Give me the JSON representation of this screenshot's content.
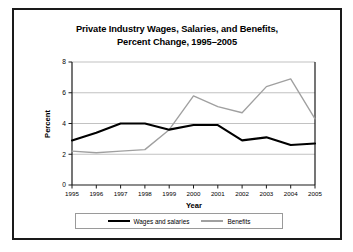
{
  "chart_data": {
    "type": "line",
    "title": "Private Industry Wages, Salaries, and Benefits, Percent Change, 1995–2005",
    "title_line1": "Private Industry Wages, Salaries, and Benefits,",
    "title_line2": "Percent Change, 1995–2005",
    "xlabel": "Year",
    "ylabel": "Percent",
    "categories": [
      "1995",
      "1996",
      "1997",
      "1998",
      "1999",
      "2000",
      "2001",
      "2002",
      "2003",
      "2004",
      "2005"
    ],
    "x": [
      1995,
      1996,
      1997,
      1998,
      1999,
      2000,
      2001,
      2002,
      2003,
      2004,
      2005
    ],
    "ylim": [
      0,
      8
    ],
    "xlim": [
      1995,
      2005
    ],
    "yticks": [
      "0",
      "2",
      "4",
      "6",
      "8"
    ],
    "ytick_values": [
      0,
      2,
      4,
      6,
      8
    ],
    "grid": true,
    "legend_position": "bottom",
    "series": [
      {
        "name": "Wages and salaries",
        "color": "#000000",
        "values": [
          2.9,
          3.4,
          4.0,
          4.0,
          3.6,
          3.9,
          3.9,
          2.9,
          3.1,
          2.6,
          2.7
        ]
      },
      {
        "name": "Benefits",
        "color": "#a0a0a0",
        "values": [
          2.2,
          2.1,
          2.2,
          2.3,
          3.6,
          5.8,
          5.1,
          4.7,
          6.4,
          6.9,
          4.3
        ]
      }
    ]
  },
  "legend": {
    "wages_label": "Wages and salaries",
    "benefits_label": "Benefits"
  },
  "colors": {
    "wages": "#000000",
    "benefits": "#a0a0a0",
    "grid": "#a8a8a8",
    "axis": "#1a1a1a",
    "background": "#ffffff"
  }
}
